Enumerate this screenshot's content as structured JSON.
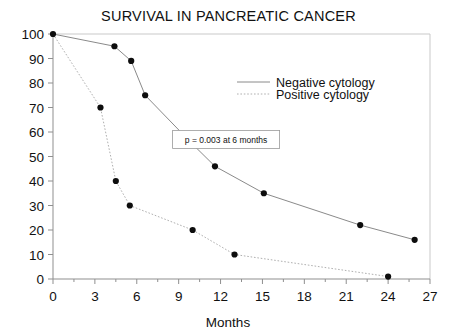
{
  "chart_data": {
    "type": "line",
    "title": "SURVIVAL IN PANCREATIC CANCER",
    "xlabel": "Months",
    "ylabel": "",
    "xlim": [
      0,
      27
    ],
    "ylim": [
      0,
      100
    ],
    "xticks": [
      0,
      3,
      6,
      9,
      12,
      15,
      18,
      21,
      24,
      27
    ],
    "yticks": [
      0,
      10,
      20,
      30,
      40,
      50,
      60,
      70,
      80,
      90,
      100
    ],
    "xtick_labels": [
      "0",
      "3",
      "6",
      "9",
      "12",
      "15",
      "18",
      "21",
      "24",
      "27"
    ],
    "ytick_labels": [
      "0",
      "10",
      "20",
      "30",
      "40",
      "50",
      "60",
      "70",
      "80",
      "90",
      "100"
    ],
    "grid": false,
    "legend_position": "upper right",
    "series": [
      {
        "name": "Negative cytology",
        "style": "solid",
        "color": "#8a8a8a",
        "points": [
          {
            "x": 0,
            "y": 100
          },
          {
            "x": 4.4,
            "y": 95
          },
          {
            "x": 5.6,
            "y": 89
          },
          {
            "x": 6.6,
            "y": 75
          },
          {
            "x": 10.0,
            "y": 55
          },
          {
            "x": 11.6,
            "y": 46
          },
          {
            "x": 15.1,
            "y": 35
          },
          {
            "x": 22.0,
            "y": 22
          },
          {
            "x": 25.9,
            "y": 16
          }
        ]
      },
      {
        "name": "Positive cytology",
        "style": "dotted",
        "color": "#b0b0b0",
        "points": [
          {
            "x": 0,
            "y": 100
          },
          {
            "x": 3.4,
            "y": 70
          },
          {
            "x": 4.5,
            "y": 40
          },
          {
            "x": 5.5,
            "y": 30
          },
          {
            "x": 10.0,
            "y": 20
          },
          {
            "x": 13.0,
            "y": 10
          },
          {
            "x": 24.0,
            "y": 1
          }
        ]
      }
    ],
    "annotations": [
      {
        "name": "p-value-note",
        "text": "p = 0.003 at 6 months",
        "x": 12.4,
        "y": 57
      }
    ]
  },
  "legend": {
    "entries": [
      {
        "label": "Negative cytology",
        "style": "solid"
      },
      {
        "label": "Positive cytology",
        "style": "dotted"
      }
    ]
  }
}
